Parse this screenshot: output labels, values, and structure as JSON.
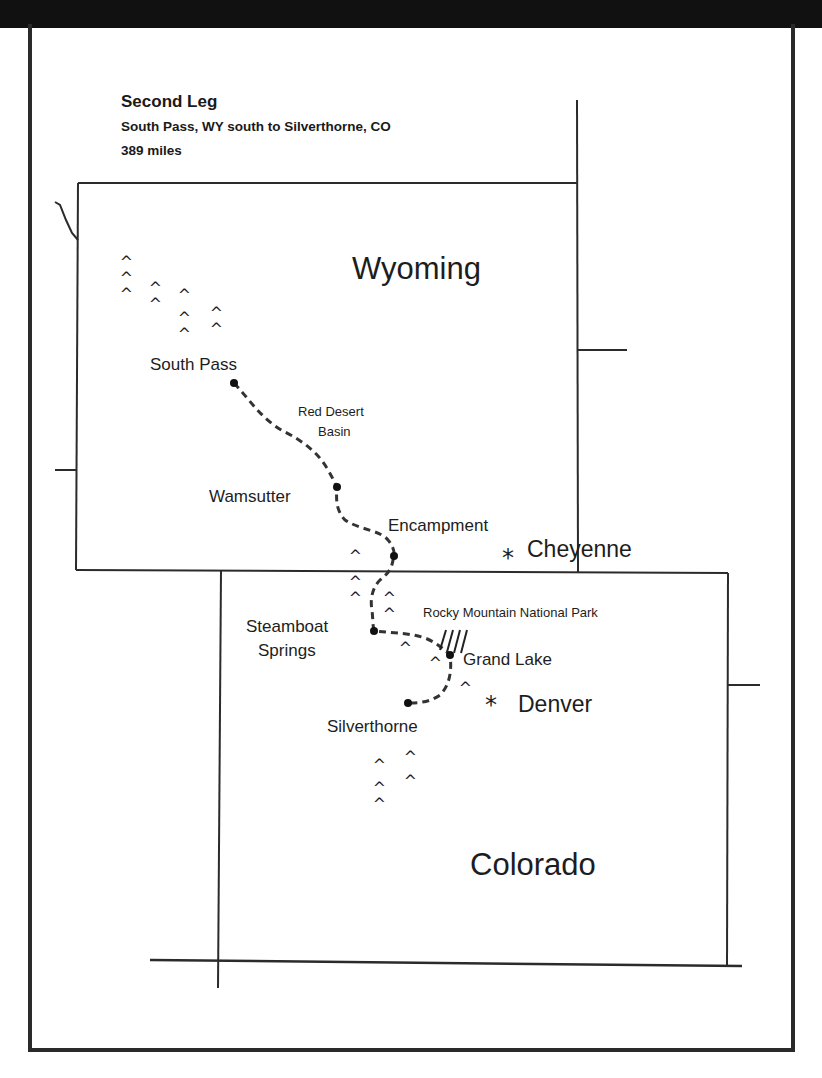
{
  "header": {
    "title": "Second Leg",
    "subtitle": "South Pass, WY south to Silverthorne, CO",
    "distance": "389 miles"
  },
  "states": [
    {
      "name": "Wyoming"
    },
    {
      "name": "Colorado"
    }
  ],
  "places": {
    "south_pass": "South Pass",
    "red_desert": "Red Desert",
    "basin": "Basin",
    "wamsutter": "Wamsutter",
    "encampment": "Encampment",
    "cheyenne": "Cheyenne",
    "rocky_mountain_np": "Rocky Mountain National Park",
    "steamboat": "Steamboat",
    "springs": "Springs",
    "grand_lake": "Grand Lake",
    "denver": "Denver",
    "silverthorne": "Silverthorne"
  },
  "symbols": {
    "mountain": "^",
    "capital": "*",
    "park_hatch": "////"
  },
  "colors": {
    "ink": "#1d1d1d",
    "frame": "#2a2a2a",
    "background": "#ffffff"
  }
}
